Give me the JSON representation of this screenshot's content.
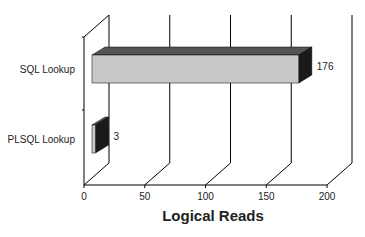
{
  "chart_data": {
    "type": "bar",
    "orientation": "horizontal",
    "style": "3d",
    "title": "",
    "xlabel": "Logical Reads",
    "ylabel": "",
    "categories": [
      "SQL Lookup",
      "PLSQL Lookup"
    ],
    "values": [
      176,
      3
    ],
    "data_labels": [
      "176",
      "3"
    ],
    "xlim": [
      0,
      200
    ],
    "xticks": [
      "0",
      "50",
      "100",
      "150",
      "200"
    ],
    "grid": true,
    "legend": null,
    "colors": {
      "bar_face": "#c8c8c8",
      "bar_top": "#555555",
      "bar_side": "#1a1a1a",
      "axis": "#000000"
    }
  }
}
